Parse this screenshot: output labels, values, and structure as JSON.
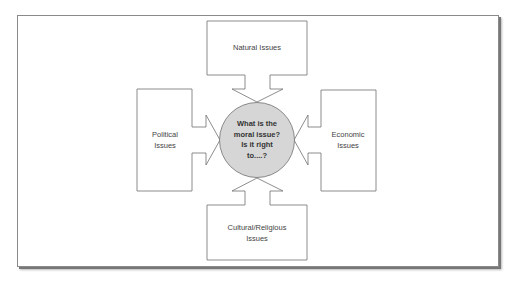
{
  "diagram": {
    "center": {
      "line1": "What is the",
      "line2": "moral issue?",
      "line3": "Is it right",
      "line4": "to....?",
      "fill": "#d6d6d6"
    },
    "top": {
      "line1": "Natural Issues"
    },
    "left": {
      "line1": "Political",
      "line2": "Issues"
    },
    "right": {
      "line1": "Economic",
      "line2": "Issues"
    },
    "bottom": {
      "line1": "Cultural/Religious",
      "line2": "Issues"
    },
    "colors": {
      "stroke": "#707070",
      "text": "#444444",
      "frame": "#8a8a8a"
    }
  }
}
